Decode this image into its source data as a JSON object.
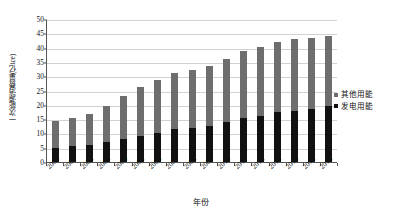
{
  "chart_data": {
    "type": "bar",
    "subtype": "stacked-vertical",
    "title": "",
    "xlabel": "年份",
    "ylabel": "一次能源消费量(亿tce)",
    "ylim": [
      0,
      50
    ],
    "ytick_step": 5,
    "yticks": [
      "50",
      "45",
      "40",
      "35",
      "30",
      "25",
      "20",
      "15",
      "10",
      "5",
      "0"
    ],
    "grid": true,
    "grid_axis": "y",
    "legend_position": "right",
    "categories": [
      "2000",
      "2001",
      "2002",
      "2003",
      "2004",
      "2005",
      "2006",
      "2007",
      "2008",
      "2009",
      "2010",
      "2011",
      "2012",
      "2013",
      "2014",
      "2015",
      "2016"
    ],
    "series": [
      {
        "name": "发电用能",
        "color": "#111111",
        "values": [
          5.0,
          5.5,
          6.0,
          7.0,
          8.1,
          9.1,
          10.3,
          11.7,
          12.0,
          12.6,
          14.0,
          15.4,
          16.1,
          17.4,
          18.0,
          18.4,
          19.6
        ]
      },
      {
        "name": "其他用能",
        "color": "#6e6e6e",
        "values": [
          9.4,
          9.9,
          10.7,
          12.7,
          14.9,
          17.1,
          18.4,
          19.6,
          20.2,
          21.1,
          22.1,
          23.5,
          24.2,
          24.5,
          25.0,
          24.8,
          24.3
        ]
      }
    ],
    "totals": [
      14.4,
      15.4,
      16.7,
      19.7,
      23.0,
      26.2,
      28.7,
      31.3,
      32.2,
      33.7,
      36.1,
      38.9,
      40.3,
      41.9,
      43.0,
      43.2,
      43.9
    ]
  },
  "legend": {
    "items": [
      {
        "label": "其他用能",
        "color": "#6e6e6e"
      },
      {
        "label": "发电用能",
        "color": "#111111"
      }
    ]
  }
}
